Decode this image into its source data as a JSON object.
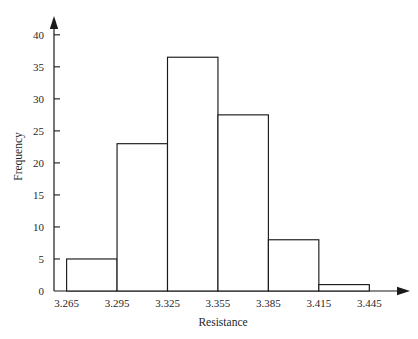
{
  "chart_data": {
    "type": "bar",
    "title": "",
    "subtitle": "",
    "xlabel": "Resistance",
    "ylabel": "Frequency",
    "orientation": "vertical",
    "grid": false,
    "legend": false,
    "legend_position": "none",
    "bin_width": 0.03,
    "bin_edges": [
      3.265,
      3.295,
      3.325,
      3.355,
      3.385,
      3.415,
      3.445
    ],
    "categories": [
      "3.265-3.295",
      "3.295-3.325",
      "3.325-3.355",
      "3.355-3.385",
      "3.385-3.415",
      "3.415-3.445"
    ],
    "values": [
      5,
      23,
      36.5,
      27.5,
      8,
      1
    ],
    "x_tick_labels": [
      "3.265",
      "3.295",
      "3.325",
      "3.355",
      "3.385",
      "3.415",
      "3.445"
    ],
    "x_tick_values": [
      3.265,
      3.295,
      3.325,
      3.355,
      3.385,
      3.415,
      3.445
    ],
    "y_tick_labels": [
      "0",
      "5",
      "10",
      "15",
      "20",
      "25",
      "30",
      "35",
      "40"
    ],
    "y_tick_values": [
      0,
      5,
      10,
      15,
      20,
      25,
      30,
      35,
      40
    ],
    "xlim": [
      3.2575,
      3.4585
    ],
    "ylim": [
      0,
      42
    ],
    "bar_fill_color": "#ffffff",
    "bar_edge_color": "#1a1a1a",
    "axis_color": "#1a1a1a",
    "background_color": "#ffffff"
  }
}
